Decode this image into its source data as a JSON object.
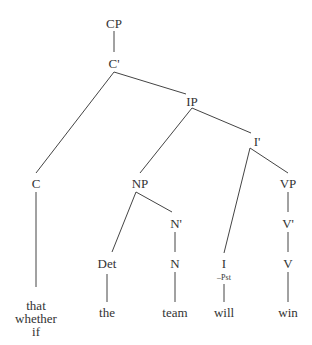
{
  "tree": {
    "nodes": {
      "cp": "CP",
      "c_bar": "C'",
      "ip": "IP",
      "i_bar": "I'",
      "c": "C",
      "np": "NP",
      "vp": "VP",
      "n_bar": "N'",
      "v_bar": "V'",
      "i": "I",
      "i_feature": "–Pst",
      "det": "Det",
      "n": "N",
      "v": "V"
    },
    "leaves": {
      "c_words": [
        "that",
        "whether",
        "if"
      ],
      "det": "the",
      "n": "team",
      "i": "will",
      "v": "win"
    }
  }
}
